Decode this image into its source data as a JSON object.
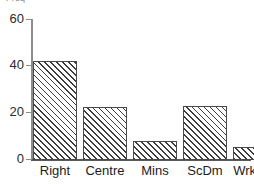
{
  "chart_data": {
    "type": "bar",
    "title": "",
    "subtitle": "",
    "xlabel": "",
    "ylabel": "Freq",
    "ylabel_clipped": true,
    "categories": [
      "Right",
      "Centre",
      "Mins",
      "ScDm",
      "Wrkrs"
    ],
    "values": [
      42,
      22.5,
      8,
      23,
      5.5
    ],
    "series": [
      {
        "name": "Frequency",
        "values": [
          42,
          22.5,
          8,
          23,
          5.5
        ]
      }
    ],
    "ylim": [
      0,
      60
    ],
    "yticks": [
      0,
      20,
      40,
      60
    ],
    "ytick_labels": [
      "0",
      "20",
      "40",
      "60"
    ],
    "grid": false,
    "legend": null,
    "legend_position": "none",
    "annotations": [],
    "bar_fill": "hatched-diagonal",
    "colors": {
      "bar_edge": "#4a4a4a",
      "bar_hatch": "#3d3d3d",
      "bar_background": "#ffffff",
      "axis": "#5a5a5a",
      "text": "#1c1c1c",
      "ylabel_text": "#8a8a8a",
      "plot_background": "#ffffff"
    }
  }
}
